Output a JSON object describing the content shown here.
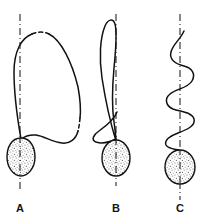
{
  "figure": {
    "title": "",
    "background_color": "#ffffff",
    "ink_color": "#111111",
    "stipple_fill_color": "#9a9a9a",
    "width": 202,
    "height": 223,
    "panel_count": 3
  },
  "panels": [
    {
      "id": "A",
      "label": "A",
      "label_x": 20,
      "label_y": 208,
      "description": "Teardrop body on vertical dash-dot axis with a single broad tall loop of filament arching far to the right; loop apex and right descending limb contain short broken (dashed) gaps.",
      "axis": {
        "style": "dash-dot",
        "x": 20,
        "y_top": 14,
        "y_bottom": 190,
        "color": "#111111"
      },
      "body": {
        "shape": "teardrop",
        "center_x": 21,
        "center_y": 157,
        "radius_x": 14,
        "radius_y": 19,
        "fill": "stipple",
        "outline_color": "#111111"
      },
      "curve": {
        "type": "single-large-loop",
        "apex_x": 38,
        "apex_y": 33,
        "rightmost_x": 82,
        "rightmost_y": 120,
        "dashed_gaps": 2
      }
    },
    {
      "id": "B",
      "label": "B",
      "label_x": 116,
      "label_y": 208,
      "description": "Oval body on vertical dash-dot axis with a narrow elongated upper loop crossing the axis and a smaller lower loop looping to the left near the body.",
      "axis": {
        "style": "dash-dot",
        "x": 116,
        "y_top": 14,
        "y_bottom": 186,
        "color": "#111111"
      },
      "body": {
        "shape": "ellipse",
        "center_x": 116,
        "center_y": 158,
        "radius_x": 14,
        "radius_y": 18,
        "fill": "stipple",
        "outline_color": "#111111"
      },
      "curve": {
        "type": "double-loop",
        "upper_loop_apex_x": 108,
        "upper_loop_apex_y": 21,
        "lower_loop_leftmost_x": 94,
        "lower_loop_leftmost_y": 128,
        "dashed_gaps": 0
      }
    },
    {
      "id": "C",
      "label": "C",
      "label_x": 180,
      "label_y": 208,
      "description": "Oval body on vertical dash-dot axis with a tightly undulating zig-zag / wavy filament weaving repeatedly back and forth across the axis.",
      "axis": {
        "style": "dash-dot",
        "x": 180,
        "y_top": 14,
        "y_bottom": 200,
        "color": "#111111"
      },
      "body": {
        "shape": "ellipse",
        "center_x": 180,
        "center_y": 167,
        "radius_x": 15,
        "radius_y": 17,
        "fill": "stipple",
        "outline_color": "#111111"
      },
      "curve": {
        "type": "undulating-wave",
        "wave_count": 4,
        "top_x": 184,
        "top_y": 31,
        "amplitude": 14,
        "dashed_gaps": 0
      }
    }
  ]
}
